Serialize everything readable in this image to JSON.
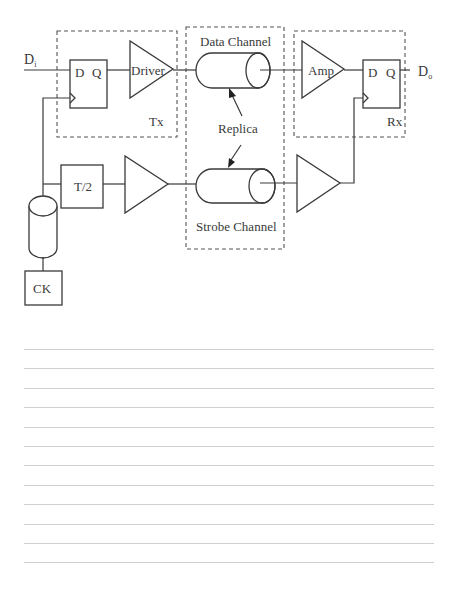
{
  "diagram": {
    "labels": {
      "input": "D",
      "input_sub": "i",
      "output": "D",
      "output_sub": "o",
      "tx_ff_d": "D",
      "tx_ff_q": "Q",
      "driver": "Driver",
      "tx_block": "Tx",
      "data_channel": "Data Channel",
      "replica": "Replica",
      "strobe_channel": "Strobe Channel",
      "amp": "Amp",
      "rx_ff_d": "D",
      "rx_ff_q": "Q",
      "rx_block": "Rx",
      "half_period": "T/2",
      "clock": "CK"
    },
    "colors": {
      "line": "#3a3a3a",
      "ruled_line": "#cfcfcf",
      "background": "#ffffff"
    }
  },
  "notes_area": {
    "ruled_line_count": 12
  }
}
